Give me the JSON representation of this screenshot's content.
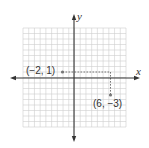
{
  "chart_data": {
    "type": "scatter",
    "title": "",
    "xlabel": "x",
    "ylabel": "y",
    "grid": true,
    "xlim": [
      -9,
      9
    ],
    "ylim": [
      -9,
      9
    ],
    "points": [
      {
        "x": -2,
        "y": 1,
        "label": "(−2, 1)",
        "guide": "horizontal-dashed-to-x-6"
      },
      {
        "x": 6,
        "y": -3,
        "label": "(6, −3)",
        "guide": "vertical-dashed-from-y-1"
      }
    ]
  },
  "labels": {
    "x_axis": "x",
    "y_axis": "y",
    "point_a": "(−2, 1)",
    "point_b": "(6, −3)"
  },
  "colors": {
    "grid": "#c8c8c8",
    "axis": "#333333",
    "point": "#777777",
    "dashed": "#555555"
  }
}
